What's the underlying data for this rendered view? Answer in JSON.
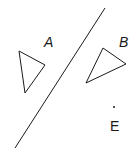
{
  "diagram": {
    "line": {
      "x1": 105,
      "y1": 8,
      "x2": 15,
      "y2": 148
    },
    "triangles": [
      {
        "label": "A",
        "points": "19,51 45,65 25,93",
        "label_pos": [
          44,
          47
        ]
      },
      {
        "label": "B",
        "points": "103,48 126,64 86,83",
        "label_pos": [
          119,
          47
        ]
      }
    ],
    "point": {
      "label": "E",
      "x": 114,
      "y": 107,
      "label_pos": [
        110,
        131
      ]
    },
    "colors": {
      "stroke": "#1a1a1a",
      "background": "#ffffff"
    }
  }
}
